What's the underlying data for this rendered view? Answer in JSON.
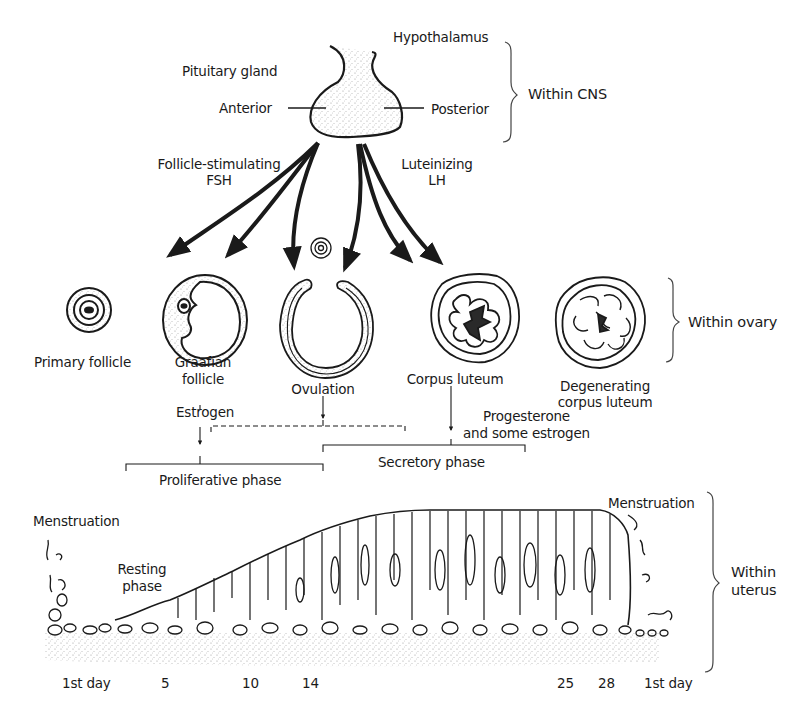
{
  "diagram": {
    "type": "menstrual-cycle-hormone-flow",
    "sections": {
      "cns": {
        "bracket_label": "Within CNS",
        "hypothalamus": "Hypothalamus",
        "pituitary": "Pituitary gland",
        "anterior": "Anterior",
        "posterior": "Posterior"
      },
      "hormones": {
        "fsh_line1": "Follicle-stimulating",
        "fsh_line2": "FSH",
        "lh_line1": "Luteinizing",
        "lh_line2": "LH"
      },
      "ovary": {
        "bracket_label": "Within ovary",
        "stages": [
          {
            "id": "primary",
            "label_line1": "Primary follicle",
            "label_line2": ""
          },
          {
            "id": "graafian",
            "label_line1": "Graafian",
            "label_line2": "follicle"
          },
          {
            "id": "ovulation",
            "label_line1": "Ovulation",
            "label_line2": ""
          },
          {
            "id": "corpus-luteum",
            "label_line1": "Corpus luteum",
            "label_line2": ""
          },
          {
            "id": "degenerating",
            "label_line1": "Degenerating",
            "label_line2": "corpus luteum"
          }
        ]
      },
      "secretions": {
        "estrogen": "Estrogen",
        "progesterone_line1": "Progesterone",
        "progesterone_line2": "and some estrogen"
      },
      "phases": {
        "proliferative": "Proliferative phase",
        "secretory": "Secretory phase"
      },
      "uterus": {
        "bracket_label_line1": "Within",
        "bracket_label_line2": "uterus",
        "menstruation_start": "Menstruation",
        "menstruation_end": "Menstruation",
        "resting_line1": "Resting",
        "resting_line2": "phase",
        "days": [
          "1st day",
          "5",
          "10",
          "14",
          "25",
          "28",
          "1st day"
        ]
      }
    },
    "colors": {
      "ink": "#1a1a1a",
      "background": "#ffffff",
      "stipple": "#b8b8b8"
    }
  }
}
